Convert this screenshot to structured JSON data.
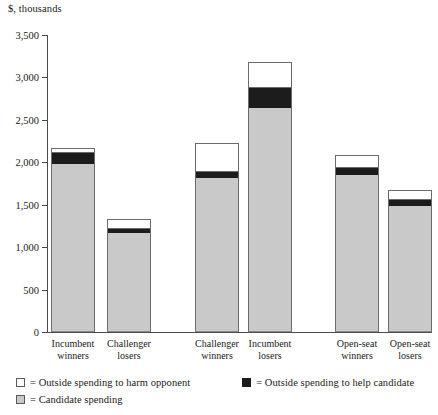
{
  "chart_data": {
    "type": "bar",
    "subtype": "stacked-vertical",
    "title": "",
    "axis_caption": "$, thousands",
    "xlabel": "",
    "ylabel": "$, thousands",
    "ylim": [
      0,
      3500
    ],
    "ytick_step": 500,
    "ytick_labels": [
      "3,500",
      "3,000",
      "2,500",
      "2,000",
      "1,500",
      "1,000",
      "500",
      "0"
    ],
    "ytick_values": [
      3500,
      3000,
      2500,
      2000,
      1500,
      1000,
      500,
      0
    ],
    "grid": false,
    "legend_position": "bottom-left",
    "categories": [
      "Incumbent winners",
      "Challenger losers",
      "Challenger winners",
      "Incumbent losers",
      "Open-seat winners",
      "Open-seat losers"
    ],
    "category_lines": [
      [
        "Incumbent",
        "winners"
      ],
      [
        "Challenger",
        "losers"
      ],
      [
        "Challenger",
        "winners"
      ],
      [
        "Incumbent",
        "losers"
      ],
      [
        "Open-seat",
        "winners"
      ],
      [
        "Open-seat",
        "losers"
      ]
    ],
    "series": [
      {
        "name": "Candidate spending",
        "color": "#c9c9c9",
        "values": [
          1975,
          1165,
          1810,
          2645,
          1845,
          1480
        ]
      },
      {
        "name": "Outside spending to help candidate",
        "color": "#1c1c1c",
        "values": [
          130,
          45,
          70,
          225,
          85,
          70
        ]
      },
      {
        "name": "Outside spending to harm opponent",
        "color": "#ffffff",
        "values": [
          60,
          120,
          350,
          310,
          155,
          120
        ]
      }
    ],
    "totals": [
      2165,
      1330,
      2230,
      3180,
      2085,
      1670
    ]
  },
  "legend": {
    "harm_label": "= Outside spending to harm opponent",
    "help_label": "= Outside spending to help candidate",
    "candidate_label": "= Candidate spending"
  },
  "colors": {
    "candidate_spending": "#c9c9c9",
    "outside_help": "#1c1c1c",
    "outside_harm": "#ffffff",
    "axis": "#4a4a4a",
    "text": "#1a1a1a"
  }
}
